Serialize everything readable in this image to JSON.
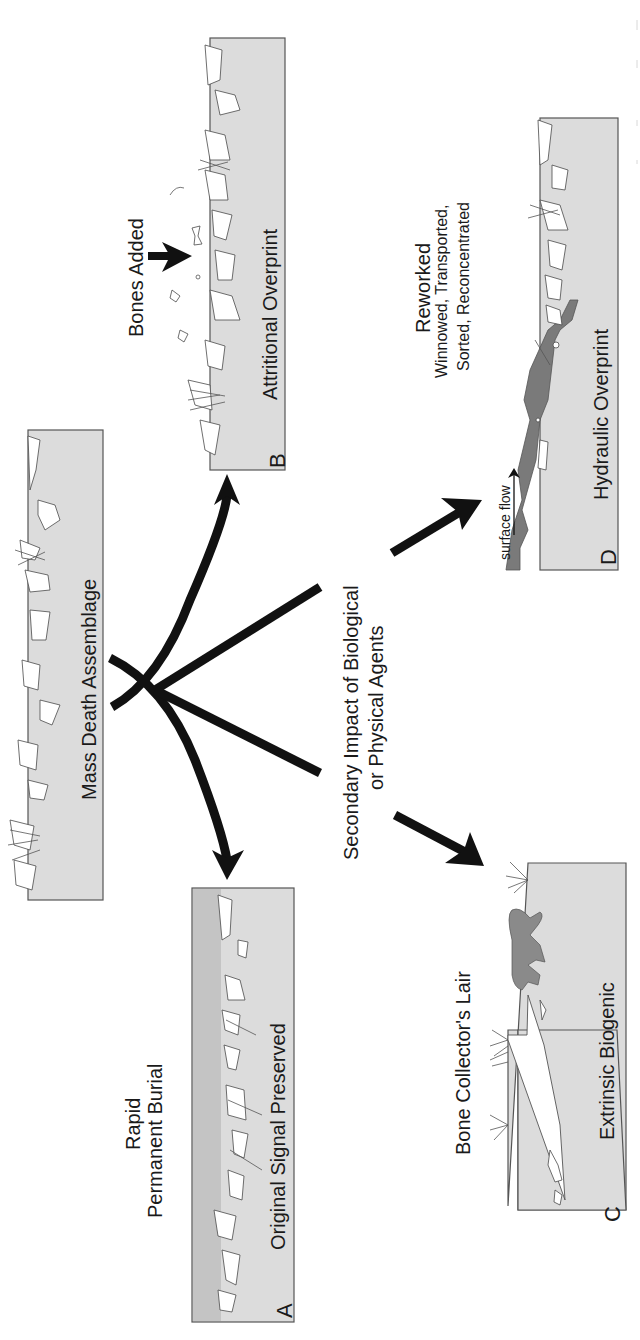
{
  "diagram": {
    "orientation": "rotated-90-ccw",
    "center_node": {
      "title": "Mass Death Assemblage"
    },
    "central_label": {
      "line1": "Secondary Impact of Biological",
      "line2": "or Physical Agents"
    },
    "branches": [
      {
        "letter": "A",
        "title": "Original Signal Preserved",
        "process_line1": "Rapid",
        "process_line2": "Permanent Burial"
      },
      {
        "letter": "B",
        "title": "Attritional Overprint",
        "process_line1": "Bones Added"
      },
      {
        "letter": "C",
        "title": "Extrinsic Biogenic",
        "process_line1": "Bone Collector's Lair"
      },
      {
        "letter": "D",
        "title": "Hydraulic Overprint",
        "process_line1": "Reworked",
        "process_line2": "Winnowed, Transported,",
        "process_line3": "Sorted, Reconcentrated",
        "annotation": "surface flow"
      }
    ],
    "colors": {
      "panel_fill": "#dcdcdc",
      "panel_dark_fill": "#c4c4c4",
      "sediment_dark": "#7a7a7a",
      "animal_fill": "#8a8a8a",
      "arrow": "#111111",
      "text": "#1a1a1a"
    }
  }
}
